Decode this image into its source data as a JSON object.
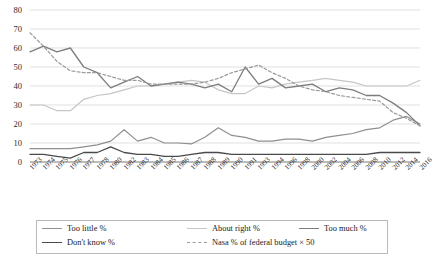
{
  "chart_data": {
    "type": "line",
    "title": "",
    "xlabel": "",
    "ylabel": "",
    "ylim": [
      0,
      80
    ],
    "yticks": [
      0,
      10,
      20,
      30,
      40,
      50,
      60,
      70,
      80
    ],
    "grid": true,
    "legend_position": "bottom",
    "categories": [
      "1973",
      "1974",
      "1975",
      "1976",
      "1977",
      "1978",
      "1980",
      "1982",
      "1983",
      "1984",
      "1985",
      "1986",
      "1987",
      "1988",
      "1989",
      "1990",
      "1991",
      "1993",
      "1994",
      "1996",
      "1998",
      "2000",
      "2002",
      "2004",
      "2006",
      "2008",
      "2010",
      "2012",
      "2014",
      "2016"
    ],
    "series": [
      {
        "name": "Too little %",
        "color": "#8f8f8f",
        "style": "solid",
        "values": [
          7,
          7,
          7,
          7,
          8,
          9,
          11,
          17,
          11,
          13,
          10,
          10,
          9.5,
          13,
          18,
          14,
          13,
          11,
          11,
          12,
          12,
          11,
          13,
          14,
          15,
          17,
          18,
          22,
          24,
          20
        ]
      },
      {
        "name": "About right %",
        "color": "#c6c6c6",
        "style": "solid",
        "values": [
          30,
          30,
          27,
          27,
          33,
          35,
          36,
          38,
          40,
          40,
          41,
          42,
          43,
          42,
          38,
          36,
          36,
          40,
          39,
          41,
          42,
          43,
          44,
          43,
          42,
          40,
          40,
          40,
          40,
          43
        ]
      },
      {
        "name": "Too much %",
        "color": "#7d7d7d",
        "style": "solid",
        "values": [
          58,
          61,
          58,
          60,
          50,
          47,
          39,
          42,
          45,
          40,
          41,
          42,
          41,
          39,
          41,
          37,
          50,
          41,
          44,
          39,
          40,
          41,
          37,
          39,
          38,
          35,
          35,
          31,
          26,
          19
        ]
      },
      {
        "name": "Don't know %",
        "color": "#4a4a4a",
        "style": "solid",
        "values": [
          4,
          4,
          3,
          2,
          5,
          5,
          8,
          5,
          4,
          4,
          3,
          3,
          4,
          5,
          5,
          4,
          4,
          4,
          4,
          4,
          4,
          4,
          4,
          4,
          4,
          4,
          5,
          5,
          5,
          5
        ]
      },
      {
        "name": "Nasa % of federal budget × 50",
        "color": "#9a9a9a",
        "style": "dashed",
        "values": [
          68,
          61,
          53,
          48,
          47,
          47,
          45,
          43,
          43,
          41,
          41,
          41,
          41,
          42,
          44,
          47,
          49,
          51,
          47,
          44,
          40,
          38,
          37,
          35,
          34,
          33,
          32,
          26,
          23,
          19
        ]
      }
    ]
  },
  "legend": {
    "items": [
      {
        "label": "Too little %"
      },
      {
        "label": "About right %"
      },
      {
        "label": "Too much %"
      },
      {
        "label": "Don't know %"
      },
      {
        "label": "Nasa % of federal budget × 50"
      }
    ]
  }
}
